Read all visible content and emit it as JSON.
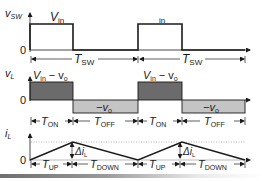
{
  "figure": {
    "panels": [
      {
        "id": "vsw",
        "axis_label": "v",
        "axis_label_sub": "SW",
        "zero_label": "0",
        "level_labels": [
          {
            "main": "V",
            "sub": "in"
          },
          {
            "main": "V",
            "sub": "in"
          }
        ],
        "interval_labels": [
          {
            "main": "T",
            "sub": "SW"
          },
          {
            "main": "T",
            "sub": "SW"
          }
        ]
      },
      {
        "id": "vL",
        "axis_label": "v",
        "axis_label_sub": "L",
        "zero_label": "0",
        "positive_labels": [
          {
            "text": "V",
            "sub": "in",
            "rest": " − v",
            "rest_sub": "o"
          },
          {
            "text": "V",
            "sub": "in",
            "rest": " − v",
            "rest_sub": "o"
          }
        ],
        "negative_labels": [
          {
            "text": "−v",
            "sub": "o"
          },
          {
            "text": "−v",
            "sub": "o"
          }
        ],
        "interval_labels": [
          {
            "main": "T",
            "sub": "ON"
          },
          {
            "main": "T",
            "sub": "OFF"
          },
          {
            "main": "T",
            "sub": "ON"
          },
          {
            "main": "T",
            "sub": "OFF"
          }
        ]
      },
      {
        "id": "iL",
        "axis_label": "i",
        "axis_label_sub": "L",
        "zero_label": "0",
        "ripple_labels": [
          {
            "main": "Δi",
            "sub": "L"
          },
          {
            "main": "Δi",
            "sub": "L"
          }
        ],
        "interval_labels": [
          {
            "main": "T",
            "sub": "UP"
          },
          {
            "main": "T",
            "sub": "DOWN"
          },
          {
            "main": "T",
            "sub": "UP"
          },
          {
            "main": "T",
            "sub": "DOWN"
          }
        ]
      }
    ],
    "colors": {
      "line": "#1a1a1a",
      "positive_fill": "#6b6b6b",
      "negative_fill": "#c4c4c4",
      "dotted": "#9a9a9a"
    }
  }
}
